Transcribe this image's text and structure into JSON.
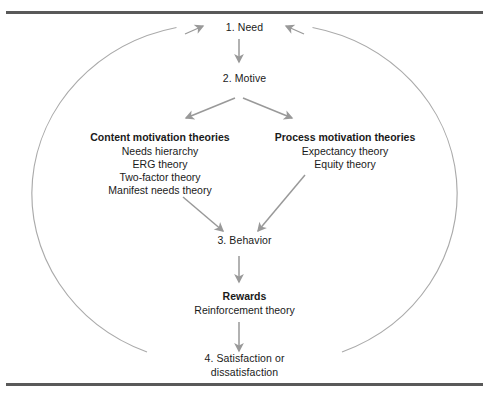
{
  "figure": {
    "name": "motivation-process-model",
    "background_color": "#ffffff",
    "rule_color": "#595959",
    "arrow_color": "#999999",
    "circle_color": "#aaaaaa",
    "text_color": "#1a1a1a"
  },
  "nodes": {
    "need": {
      "label": "1. Need"
    },
    "motive": {
      "label": "2. Motive"
    },
    "behavior": {
      "label": "3. Behavior"
    },
    "satisfaction": {
      "line1": "4. Satisfaction or",
      "line2": "dissatisfaction"
    }
  },
  "groups": {
    "content": {
      "title": "Content motivation theories",
      "items": [
        "Needs hierarchy",
        "ERG theory",
        "Two-factor theory",
        "Manifest needs theory"
      ]
    },
    "process": {
      "title": "Process motivation theories",
      "items": [
        "Expectancy theory",
        "Equity theory"
      ]
    },
    "rewards": {
      "title": "Rewards",
      "items": [
        "Reinforcement theory"
      ]
    }
  },
  "connectors": [
    {
      "name": "need-to-motive",
      "from": "1. Need",
      "to": "2. Motive"
    },
    {
      "name": "motive-to-content",
      "from": "2. Motive",
      "to": "Content motivation theories"
    },
    {
      "name": "motive-to-process",
      "from": "2. Motive",
      "to": "Process motivation theories"
    },
    {
      "name": "content-to-behavior",
      "from": "Content motivation theories",
      "to": "3. Behavior"
    },
    {
      "name": "process-to-behavior",
      "from": "Process motivation theories",
      "to": "3. Behavior"
    },
    {
      "name": "behavior-to-rewards",
      "from": "3. Behavior",
      "to": "Rewards"
    },
    {
      "name": "rewards-to-satisfaction",
      "from": "Rewards",
      "to": "4. Satisfaction or dissatisfaction"
    },
    {
      "name": "feedback-loop-left",
      "from": "4. Satisfaction or dissatisfaction",
      "to": "1. Need"
    },
    {
      "name": "feedback-loop-right",
      "from": "4. Satisfaction or dissatisfaction",
      "to": "1. Need"
    }
  ]
}
